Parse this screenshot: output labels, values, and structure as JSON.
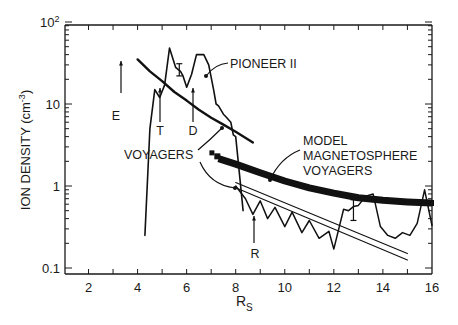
{
  "chart_data": {
    "type": "line",
    "title": "",
    "xlabel": "R_S",
    "ylabel": "ION DENSITY (cm^-3)",
    "xlim": [
      1,
      16
    ],
    "ylim": [
      0.1,
      100
    ],
    "yscale": "log",
    "x_ticks": [
      2,
      4,
      6,
      8,
      10,
      12,
      14,
      16
    ],
    "x_tick_labels": [
      "2",
      "4",
      "6",
      "8",
      "10",
      "12",
      "14",
      "16"
    ],
    "y_ticks": [
      0.1,
      1,
      10,
      100
    ],
    "y_tick_labels": [
      "0.1",
      "1",
      "10",
      "10²"
    ],
    "grid": false,
    "legend": "none (inline annotations)",
    "series": [
      {
        "name": "PIONEER II",
        "style": "thin jagged line",
        "points": [
          [
            4.3,
            0.25
          ],
          [
            4.5,
            5
          ],
          [
            4.7,
            15
          ],
          [
            4.9,
            12
          ],
          [
            5.1,
            17
          ],
          [
            5.3,
            48
          ],
          [
            5.55,
            28
          ],
          [
            5.75,
            25
          ],
          [
            5.85,
            22
          ],
          [
            6.0,
            16
          ],
          [
            6.2,
            23
          ],
          [
            6.4,
            40
          ],
          [
            6.7,
            40
          ],
          [
            6.9,
            30
          ],
          [
            7.1,
            15
          ],
          [
            7.2,
            10
          ],
          [
            7.3,
            9.5
          ],
          [
            7.5,
            7.5
          ],
          [
            7.6,
            7
          ],
          [
            7.8,
            6
          ],
          [
            7.9,
            4.2
          ],
          [
            8.0,
            4
          ],
          [
            8.1,
            2
          ],
          [
            8.3,
            0.5
          ]
        ]
      },
      {
        "name": "VOYAGERS (inner)",
        "style": "thick smooth line",
        "points": [
          [
            4.0,
            35
          ],
          [
            4.5,
            25
          ],
          [
            5.0,
            19
          ],
          [
            5.5,
            14
          ],
          [
            6.0,
            11
          ],
          [
            6.5,
            8.5
          ],
          [
            7.0,
            6.8
          ],
          [
            7.5,
            5.6
          ],
          [
            8.0,
            4.6
          ],
          [
            8.7,
            3.4
          ]
        ]
      },
      {
        "name": "VOYAGERS (outer, jagged)",
        "style": "thin jagged line",
        "points": [
          [
            8.0,
            1.0
          ],
          [
            8.4,
            0.7
          ],
          [
            8.7,
            0.45
          ],
          [
            9.0,
            0.66
          ],
          [
            9.3,
            0.4
          ],
          [
            9.6,
            0.55
          ],
          [
            10.0,
            0.32
          ],
          [
            10.3,
            0.48
          ],
          [
            10.7,
            0.27
          ],
          [
            11.0,
            0.38
          ],
          [
            11.4,
            0.23
          ],
          [
            11.8,
            0.28
          ],
          [
            12.0,
            0.17
          ],
          [
            12.4,
            0.52
          ],
          [
            12.6,
            0.5
          ],
          [
            12.8,
            0.56
          ],
          [
            13.0,
            0.58
          ],
          [
            13.3,
            0.75
          ],
          [
            13.6,
            0.8
          ],
          [
            13.9,
            0.32
          ],
          [
            14.2,
            0.25
          ],
          [
            14.5,
            0.23
          ],
          [
            14.8,
            0.27
          ],
          [
            15.1,
            0.25
          ],
          [
            15.4,
            0.35
          ],
          [
            15.7,
            0.9
          ],
          [
            16.0,
            0.33
          ]
        ]
      },
      {
        "name": "MODEL MAGNETOSPHERE VOYAGERS",
        "style": "very thick band",
        "points": [
          [
            7.3,
            2.15
          ],
          [
            8.0,
            1.85
          ],
          [
            9.0,
            1.45
          ],
          [
            10.0,
            1.15
          ],
          [
            11.0,
            0.95
          ],
          [
            12.0,
            0.82
          ],
          [
            13.0,
            0.72
          ],
          [
            14.0,
            0.67
          ],
          [
            15.0,
            0.64
          ],
          [
            16.0,
            0.62
          ]
        ]
      },
      {
        "name": "Model fit line A",
        "style": "thin straight line",
        "points": [
          [
            8.0,
            1.1
          ],
          [
            15.0,
            0.15
          ]
        ]
      },
      {
        "name": "Model fit line B",
        "style": "thin straight line",
        "points": [
          [
            8.0,
            0.95
          ],
          [
            15.0,
            0.125
          ]
        ]
      }
    ],
    "error_bars": [
      {
        "x": 5.7,
        "y_low": 22,
        "y_high": 31
      },
      {
        "x": 12.8,
        "y_low": 0.38,
        "y_high": 0.68
      }
    ],
    "annotations": [
      {
        "text": "E",
        "type": "up-arrow",
        "x": 4.0,
        "arrow_y_top": 30,
        "arrow_y_bottom": 15
      },
      {
        "text": "T",
        "type": "up-arrow",
        "x": 5.0,
        "arrow_y_top": 12,
        "arrow_y_bottom": 5
      },
      {
        "text": "D",
        "type": "up-arrow",
        "x": 6.35,
        "arrow_y_top": 12,
        "arrow_y_bottom": 5
      },
      {
        "text": "R",
        "type": "up-arrow",
        "x": 8.9,
        "arrow_y_top": 0.5,
        "arrow_y_bottom": 0.25
      },
      {
        "text": "PIONEER II",
        "type": "label-with-arrow"
      },
      {
        "text": "VOYAGERS",
        "type": "label-with-two-arrows"
      },
      {
        "text": "MODEL MAGNETOSPHERE VOYAGERS",
        "type": "label-with-arrow"
      }
    ]
  },
  "labels": {
    "y_axis_title": "ION DENSITY (cm",
    "y_axis_exp": "-3",
    "y_axis_close": ")",
    "x_axis_title": "R",
    "x_axis_sub": "S",
    "y100": "10",
    "y100_exp": "2",
    "y10": "10",
    "y1": "1",
    "y01": "0.1",
    "pioneer": "PIONEER II",
    "voyagers": "VOYAGERS",
    "model1": "MODEL",
    "model2": "MAGNETOSPHERE",
    "model3": "VOYAGERS",
    "E": "E",
    "T": "T",
    "D": "D",
    "R": "R"
  }
}
